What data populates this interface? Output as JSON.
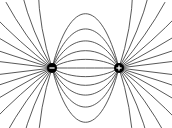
{
  "diagram": {
    "background": "#ffffff",
    "line_color": "#3a3a3a",
    "charges": [
      {
        "name": "negative-charge",
        "sign": "-",
        "x": 52,
        "y": 68,
        "r": 5
      },
      {
        "name": "positive-charge",
        "sign": "+",
        "x": 119,
        "y": 68,
        "r": 5
      }
    ],
    "connecting_lines": 7,
    "outer_rays_per_charge": 13
  }
}
